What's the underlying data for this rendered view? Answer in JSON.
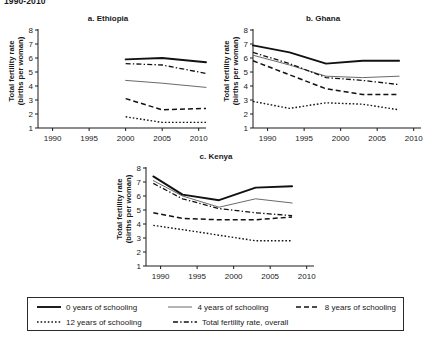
{
  "figure": {
    "title": "1990-2010"
  },
  "axis": {
    "ylabel_line1": "Total fertility rate",
    "ylabel_line2": "(births per woman)",
    "yticks": [
      "1",
      "2",
      "3",
      "4",
      "5",
      "6",
      "7",
      "8"
    ],
    "ylim": [
      1,
      8
    ],
    "xticks": [
      "1990",
      "1995",
      "2000",
      "2005",
      "2010"
    ],
    "xlim": [
      1988,
      2011
    ]
  },
  "legend": {
    "items": [
      {
        "label": "0 years of schooling",
        "style": "solid-thick",
        "color": "#111111"
      },
      {
        "label": "4 years of schooling",
        "style": "solid-thin",
        "color": "#666666"
      },
      {
        "label": "8 years of schooling",
        "style": "dashed",
        "color": "#111111"
      },
      {
        "label": "12 years of schooling",
        "style": "dotted",
        "color": "#111111"
      },
      {
        "label": "Total fertility rate, overall",
        "style": "dashdot",
        "color": "#111111"
      }
    ]
  },
  "chart_data": [
    {
      "type": "line",
      "title": "a. Ethiopia",
      "panel": "a",
      "xlabel": "",
      "ylabel": "Total fertility rate (births per woman)",
      "xlim": [
        1988,
        2011
      ],
      "ylim": [
        1,
        8
      ],
      "grid": false,
      "legend_position": "bottom-shared",
      "x": [
        2000,
        2005,
        2011
      ],
      "series": [
        {
          "name": "0 years of schooling",
          "values": [
            5.9,
            6.0,
            5.7
          ]
        },
        {
          "name": "4 years of schooling",
          "values": [
            4.4,
            4.2,
            3.9
          ]
        },
        {
          "name": "8 years of schooling",
          "values": [
            3.1,
            2.3,
            2.4
          ]
        },
        {
          "name": "12 years of schooling",
          "values": [
            1.8,
            1.4,
            1.4
          ]
        },
        {
          "name": "Total fertility rate, overall",
          "values": [
            5.6,
            5.5,
            4.9
          ]
        }
      ]
    },
    {
      "type": "line",
      "title": "b. Ghana",
      "panel": "b",
      "xlabel": "",
      "ylabel": "Total fertility rate (births per woman)",
      "xlim": [
        1988,
        2011
      ],
      "ylim": [
        1,
        8
      ],
      "grid": false,
      "legend_position": "bottom-shared",
      "x": [
        1988,
        1993,
        1998,
        2003,
        2008
      ],
      "series": [
        {
          "name": "0 years of schooling",
          "values": [
            6.9,
            6.4,
            5.6,
            5.8,
            5.8
          ]
        },
        {
          "name": "4 years of schooling",
          "values": [
            6.2,
            5.5,
            4.7,
            4.6,
            4.7
          ]
        },
        {
          "name": "8 years of schooling",
          "values": [
            5.8,
            4.8,
            3.8,
            3.4,
            3.4
          ]
        },
        {
          "name": "12 years of schooling",
          "values": [
            2.9,
            2.4,
            2.8,
            2.7,
            2.3
          ]
        },
        {
          "name": "Total fertility rate, overall",
          "values": [
            6.4,
            5.6,
            4.6,
            4.4,
            4.1
          ]
        }
      ]
    },
    {
      "type": "line",
      "title": "c. Kenya",
      "panel": "c",
      "xlabel": "",
      "ylabel": "Total fertility rate (births per woman)",
      "xlim": [
        1988,
        2011
      ],
      "ylim": [
        1,
        8
      ],
      "grid": false,
      "legend_position": "bottom-shared",
      "x": [
        1989,
        1993,
        1998,
        2003,
        2008
      ],
      "series": [
        {
          "name": "0 years of schooling",
          "values": [
            7.4,
            6.1,
            5.7,
            6.6,
            6.7
          ]
        },
        {
          "name": "4 years of schooling",
          "values": [
            7.1,
            6.0,
            5.2,
            5.8,
            5.5
          ]
        },
        {
          "name": "8 years of schooling",
          "values": [
            4.8,
            4.4,
            4.3,
            4.3,
            4.5
          ]
        },
        {
          "name": "12 years of schooling",
          "values": [
            3.9,
            3.6,
            3.2,
            2.8,
            2.8
          ]
        },
        {
          "name": "Total fertility rate, overall",
          "values": [
            6.9,
            5.8,
            5.1,
            4.8,
            4.6
          ]
        }
      ]
    }
  ]
}
